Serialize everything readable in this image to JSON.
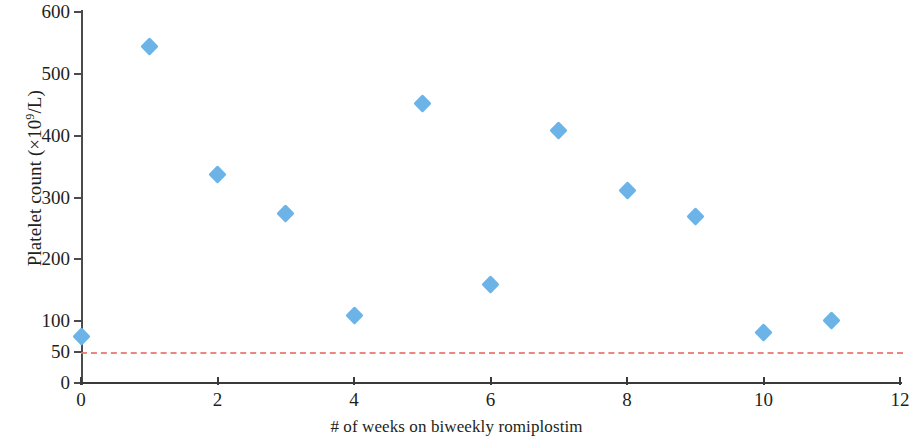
{
  "chart_data": {
    "type": "scatter",
    "title": "",
    "xlabel": "# of weeks on biweekly romiplostim",
    "ylabel": "Platelet count (×10⁹/L)",
    "ylabel_main": "Platelet count (×10",
    "ylabel_sup": "9",
    "ylabel_tail": "/L)",
    "xlim": [
      0,
      12
    ],
    "ylim": [
      0,
      600
    ],
    "grid": false,
    "legend": "none",
    "marker_shape": "diamond",
    "marker_color": "#6cb4e8",
    "axis_color": "#3a3a3a",
    "x_ticks": [
      0,
      2,
      4,
      6,
      8,
      10,
      12
    ],
    "x_tick_labels": [
      "0",
      "2",
      "4",
      "6",
      "8",
      "10",
      "12"
    ],
    "y_ticks": [
      0,
      50,
      100,
      200,
      300,
      400,
      500,
      600
    ],
    "y_tick_labels": [
      "0",
      "50",
      "100",
      "200",
      "300",
      "400",
      "500",
      "600"
    ],
    "series": [
      {
        "name": "Platelet count",
        "x": [
          0,
          1,
          2,
          3,
          4,
          5,
          6,
          7,
          8,
          9,
          10,
          11
        ],
        "values": [
          75,
          544,
          338,
          274,
          109,
          452,
          160,
          408,
          312,
          269,
          82,
          101
        ]
      }
    ],
    "reference_lines": [
      {
        "name": "platelet-threshold",
        "y": 50,
        "color": "#e8736a",
        "style": "dashed",
        "label": ""
      }
    ]
  }
}
